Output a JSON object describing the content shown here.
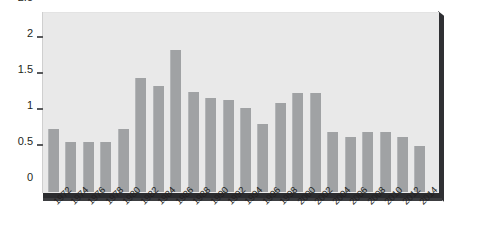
{
  "chart_data": {
    "type": "bar",
    "title": "",
    "subtitle": "",
    "xlabel": "",
    "ylabel": "",
    "categories": [
      "1972",
      "1974",
      "1976",
      "1978",
      "1980",
      "1982",
      "1984",
      "1986",
      "1988",
      "1990",
      "1992",
      "1994",
      "1996",
      "1998",
      "2000",
      "2002",
      "2004",
      "2006",
      "2008",
      "2010",
      "2012",
      "2014"
    ],
    "values": [
      0.88,
      0.69,
      0.69,
      0.69,
      0.88,
      1.58,
      1.47,
      1.97,
      1.39,
      1.3,
      1.28,
      1.17,
      0.95,
      1.24,
      1.37,
      1.37,
      0.83,
      0.77,
      0.84,
      0.84,
      0.76,
      0.64
    ],
    "series": [
      {
        "name": "",
        "values": [
          0.88,
          0.69,
          0.69,
          0.69,
          0.88,
          1.58,
          1.47,
          1.97,
          1.39,
          1.3,
          1.28,
          1.17,
          0.95,
          1.24,
          1.37,
          1.37,
          0.83,
          0.77,
          0.84,
          0.84,
          0.76,
          0.64
        ]
      }
    ],
    "ylim": [
      0,
      2.5
    ],
    "yticks": [
      0,
      0.5,
      1,
      1.5,
      2,
      2.5
    ],
    "ytick_labels": [
      "0",
      "0.5",
      "1",
      "1.5",
      "2",
      "2.5"
    ],
    "grid": false,
    "legend": null,
    "legend_position": "none",
    "annotations": [],
    "style": {
      "bar_color": "#a0a2a4",
      "bar_highlight": "#b4b6b8",
      "plot_background": "#e9e9e9",
      "page_background": "#ffffff",
      "axis_text_color": "#231f20",
      "tick_mark_color": "#58595b",
      "slab_shadow_color": "#2f3033",
      "x_label_rotation": -45
    }
  }
}
